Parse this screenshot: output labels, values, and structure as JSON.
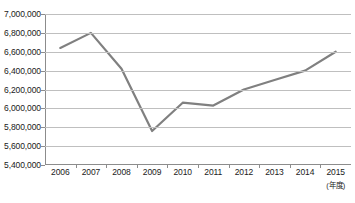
{
  "chart_data": {
    "type": "line",
    "title": "",
    "xlabel": "(年度)",
    "ylabel": "",
    "categories": [
      "2006",
      "2007",
      "2008",
      "2009",
      "2010",
      "2011",
      "2012",
      "2013",
      "2014",
      "2015"
    ],
    "values": [
      6640000,
      6800000,
      6420000,
      5760000,
      6060000,
      6030000,
      6200000,
      6300000,
      6400000,
      6600000
    ],
    "series": [
      {
        "name": "",
        "values": [
          6640000,
          6800000,
          6420000,
          5760000,
          6060000,
          6030000,
          6200000,
          6300000,
          6400000,
          6600000
        ]
      }
    ],
    "ylim": [
      5400000,
      7000000
    ],
    "ytick_step": 200000,
    "ytick_labels": [
      "7,000,000",
      "6,800,000",
      "6,600,000",
      "6,400,000",
      "6,200,000",
      "6,000,000",
      "5,800,000",
      "5,600,000",
      "5,400,000"
    ],
    "ytick_values": [
      7000000,
      6800000,
      6600000,
      6400000,
      6200000,
      6000000,
      5800000,
      5600000,
      5400000
    ],
    "grid": true,
    "legend": "none",
    "line_color": "#808080",
    "grid_color": "#bfbfbf",
    "axis_color": "#8c8c8c",
    "background_color": "#ffffff"
  }
}
